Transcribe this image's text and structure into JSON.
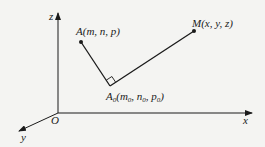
{
  "diagram": {
    "type": "3d-coordinate-geometry",
    "axes": {
      "x_label": "x",
      "y_label": "y",
      "z_label": "z",
      "origin_label": "O"
    },
    "points": {
      "A": {
        "name": "A",
        "coords": "(m, n, p)",
        "label": "A(m, n, p)"
      },
      "A0": {
        "name": "A",
        "subscript": "0",
        "coords_parts": [
          "(m",
          "0",
          ", n",
          "0",
          ", p",
          "0",
          ")"
        ],
        "label": "A0(m0, n0, p0)"
      },
      "M": {
        "name": "M",
        "coords": "(x, y, z)",
        "label": "M(x, y, z)"
      }
    },
    "segments": [
      "A-A0",
      "A0-M"
    ],
    "annotations": [
      "right angle at A0"
    ],
    "colors": {
      "line": "#1a1a1a",
      "background": "#f4f4f2"
    }
  }
}
